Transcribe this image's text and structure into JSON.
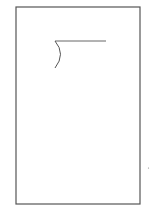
{
  "diagram": {
    "background": "#ffffff",
    "stroke_color": "#555555",
    "frame": {
      "x": 16,
      "y": 7,
      "width": 124,
      "height": 197
    },
    "horizontal_line": {
      "x1": 55,
      "y1": 41,
      "x2": 106,
      "y2": 41
    },
    "arc": {
      "start": [
        55,
        41
      ],
      "control": [
        66,
        54
      ],
      "end": [
        55,
        68
      ]
    },
    "mark": {
      "x": 149,
      "y": 168
    }
  }
}
